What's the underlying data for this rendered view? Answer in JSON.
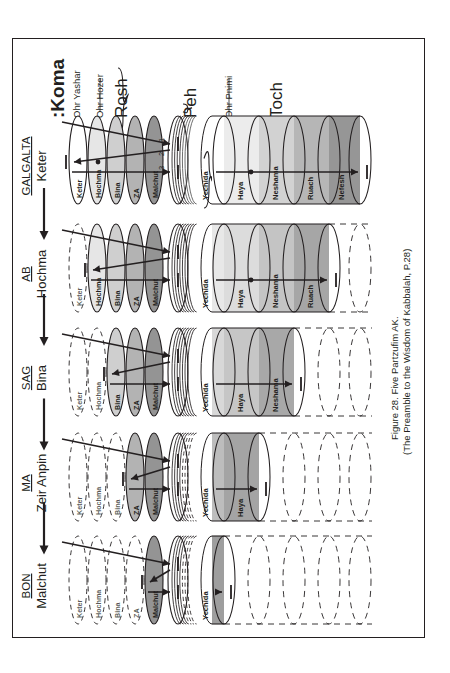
{
  "figure": {
    "caption_line1": "Figure 28. Five Partzufim AK.",
    "caption_line2": "(The Preamble to the Wisdom of Kabbalah, P.28)"
  },
  "top_labels": {
    "koma": "Koma",
    "koma_prefix": ":",
    "ohr_yashar": "Ohr Yashar",
    "ohr_hozer": "Ohr Hozer",
    "rosh": "Rosh",
    "peh": "Peh",
    "ohr_pnimi": "Ohr Pnimi",
    "toch": "Toch"
  },
  "arrow_numbers": [
    "1",
    "2",
    "3"
  ],
  "rows": [
    {
      "code": "GALGALTA",
      "partzuf": "Keter",
      "rosh": [
        {
          "label": "Keter",
          "shade": "#ffffff",
          "dashed": false
        },
        {
          "label": "Hochma",
          "shade": "#e6e6e6",
          "dashed": false
        },
        {
          "label": "Bina",
          "shade": "#cfcfcf",
          "dashed": false
        },
        {
          "label": "ZA",
          "shade": "#b3b3b3",
          "dashed": false
        },
        {
          "label": "Malchut",
          "shade": "#949494",
          "dashed": false
        }
      ],
      "toch": [
        {
          "label": "Yechida",
          "shade": "#ffffff",
          "dashed": false
        },
        {
          "label": "Haya",
          "shade": "#ececec",
          "dashed": false
        },
        {
          "label": "Neshama",
          "shade": "#d2d2d2",
          "dashed": false
        },
        {
          "label": "Ruach",
          "shade": "#b6b6b6",
          "dashed": false
        },
        {
          "label": "Nefesh",
          "shade": "#969696",
          "dashed": false
        }
      ]
    },
    {
      "code": "AB",
      "partzuf": "Hochma",
      "rosh": [
        {
          "label": "Keter",
          "shade": "#ffffff",
          "dashed": true
        },
        {
          "label": "Hochma",
          "shade": "#e6e6e6",
          "dashed": false
        },
        {
          "label": "Bina",
          "shade": "#cfcfcf",
          "dashed": false
        },
        {
          "label": "ZA",
          "shade": "#b3b3b3",
          "dashed": false
        },
        {
          "label": "Malchut",
          "shade": "#949494",
          "dashed": false
        }
      ],
      "toch": [
        {
          "label": "Yechida",
          "shade": "#e8e8e8",
          "dashed": false
        },
        {
          "label": "Haya",
          "shade": "#dcdcdc",
          "dashed": false
        },
        {
          "label": "Neshama",
          "shade": "#c4c4c4",
          "dashed": false
        },
        {
          "label": "Ruach",
          "shade": "#a6a6a6",
          "dashed": false
        },
        {
          "label": "",
          "shade": "#ffffff",
          "dashed": true
        }
      ]
    },
    {
      "code": "SAG",
      "partzuf": "Bina",
      "rosh": [
        {
          "label": "Keter",
          "shade": "#ffffff",
          "dashed": true
        },
        {
          "label": "Hochma",
          "shade": "#ffffff",
          "dashed": true
        },
        {
          "label": "Bina",
          "shade": "#cfcfcf",
          "dashed": false
        },
        {
          "label": "ZA",
          "shade": "#b3b3b3",
          "dashed": false
        },
        {
          "label": "Malchut",
          "shade": "#949494",
          "dashed": false
        }
      ],
      "toch": [
        {
          "label": "Yechida",
          "shade": "#d8d8d8",
          "dashed": false
        },
        {
          "label": "Haya",
          "shade": "#c6c6c6",
          "dashed": false
        },
        {
          "label": "Neshama",
          "shade": "#a8a8a8",
          "dashed": false
        },
        {
          "label": "",
          "shade": "#ffffff",
          "dashed": true
        },
        {
          "label": "",
          "shade": "#ffffff",
          "dashed": true
        }
      ]
    },
    {
      "code": "MA",
      "partzuf": "Zeir Anpin",
      "rosh": [
        {
          "label": "Keter",
          "shade": "#ffffff",
          "dashed": true
        },
        {
          "label": "Hochma",
          "shade": "#ffffff",
          "dashed": true
        },
        {
          "label": "Bina",
          "shade": "#ffffff",
          "dashed": true
        },
        {
          "label": "ZA",
          "shade": "#b3b3b3",
          "dashed": false
        },
        {
          "label": "Malchut",
          "shade": "#949494",
          "dashed": false
        }
      ],
      "toch": [
        {
          "label": "Yechida",
          "shade": "#bdbdbd",
          "dashed": false
        },
        {
          "label": "Haya",
          "shade": "#a4a4a4",
          "dashed": false
        },
        {
          "label": "",
          "shade": "#ffffff",
          "dashed": true
        },
        {
          "label": "",
          "shade": "#ffffff",
          "dashed": true
        },
        {
          "label": "",
          "shade": "#ffffff",
          "dashed": true
        }
      ]
    },
    {
      "code": "BON",
      "partzuf": "Malchut",
      "rosh": [
        {
          "label": "Keter",
          "shade": "#ffffff",
          "dashed": true
        },
        {
          "label": "Hochma",
          "shade": "#ffffff",
          "dashed": true
        },
        {
          "label": "Bina",
          "shade": "#ffffff",
          "dashed": true
        },
        {
          "label": "ZA",
          "shade": "#ffffff",
          "dashed": true
        },
        {
          "label": "Malchut",
          "shade": "#949494",
          "dashed": false
        }
      ],
      "toch": [
        {
          "label": "Yechida",
          "shade": "#9e9e9e",
          "dashed": false
        },
        {
          "label": "",
          "shade": "#ffffff",
          "dashed": true
        },
        {
          "label": "",
          "shade": "#ffffff",
          "dashed": true
        },
        {
          "label": "",
          "shade": "#ffffff",
          "dashed": true
        },
        {
          "label": "",
          "shade": "#ffffff",
          "dashed": true
        }
      ]
    }
  ],
  "colors": {
    "ink": "#231f20",
    "frame": "#231f20",
    "paper": "#ffffff"
  }
}
